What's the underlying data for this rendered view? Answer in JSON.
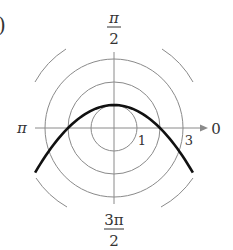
{
  "figure": {
    "partial_label": ")"
  },
  "chart_data": {
    "type": "line",
    "coordinate_system": "polar",
    "title": "",
    "curve": {
      "description": "parabola with focus at pole, opening downward",
      "equation": "r = 2/(1 + sin θ)",
      "color": "#111111",
      "points_cartesian": [
        {
          "x": -3.43,
          "y": -1.95
        },
        {
          "x": -3.0,
          "y": -1.25
        },
        {
          "x": -2.0,
          "y": 0.0
        },
        {
          "x": -1.0,
          "y": 0.75
        },
        {
          "x": 0.0,
          "y": 1.0
        },
        {
          "x": 1.0,
          "y": 0.75
        },
        {
          "x": 2.0,
          "y": 0.0
        },
        {
          "x": 3.0,
          "y": -1.25
        },
        {
          "x": 3.43,
          "y": -1.95
        }
      ]
    },
    "polar_grid": {
      "circle_radii": [
        1,
        2,
        3
      ],
      "outer_arc_radius": 4,
      "grid_color": "#888888"
    },
    "angle_labels": {
      "top": {
        "num": "π",
        "den": "2"
      },
      "bottom": {
        "num": "3π",
        "den": "2"
      },
      "left": "π",
      "right": "0"
    },
    "radius_labels": [
      "1",
      "3"
    ],
    "axis_arrow": "right"
  }
}
